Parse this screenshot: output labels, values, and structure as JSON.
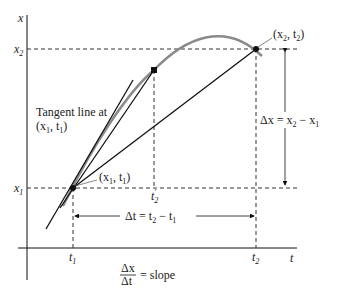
{
  "diagram": {
    "axes": {
      "y_label": "x",
      "x_label": "t"
    },
    "ticks": {
      "x1_label": "x",
      "x1_sub": "1",
      "x2_label": "x",
      "x2_sub": "2",
      "t1_label": "t",
      "t1_sub": "1",
      "t2_label": "t",
      "t2_sub": "2",
      "t2prime_label": "t",
      "t2prime_sub": "2",
      "t2prime_mark": "′"
    },
    "points": {
      "p1_label": "(x",
      "p1_sub1": "1",
      "p1_mid": ", t",
      "p1_sub2": "1",
      "p1_end": ")",
      "p2_label": "(x",
      "p2_sub1": "2",
      "p2_mid": ", t",
      "p2_sub2": "2",
      "p2_end": ")"
    },
    "annotations": {
      "tangent_line1": "Tangent line at",
      "tangent_line2_a": "(x",
      "tangent_line2_sub1": "1",
      "tangent_line2_mid": ", t",
      "tangent_line2_sub2": "1",
      "tangent_line2_end": ")",
      "delta_x_a": "Δx = x",
      "delta_x_sub1": "2",
      "delta_x_mid": " − x",
      "delta_x_sub2": "1",
      "delta_t_a": "Δt = t",
      "delta_t_sub1": "2",
      "delta_t_mid": " − t",
      "delta_t_sub2": "1",
      "slope_num": "Δx",
      "slope_den": "Δt",
      "slope_eq": "= slope"
    },
    "colors": {
      "curve": "#8a8a8a",
      "lines": "#111111",
      "dashed": "#333333"
    }
  }
}
